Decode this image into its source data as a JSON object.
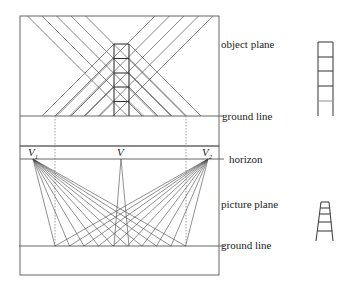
{
  "labels": {
    "object_plane": "object plane",
    "ground_line_top": "ground line",
    "horizon": "horizon",
    "picture_plane": "picture plane",
    "ground_line_bottom": "ground line"
  },
  "vanishing_points": {
    "v1": {
      "letter": "V",
      "sub": "1"
    },
    "v": {
      "letter": "V",
      "sub": ""
    },
    "v2": {
      "letter": "V",
      "sub": "2"
    }
  },
  "colors": {
    "line": "#333333",
    "frame": "#666666",
    "dotted": "#888888"
  }
}
